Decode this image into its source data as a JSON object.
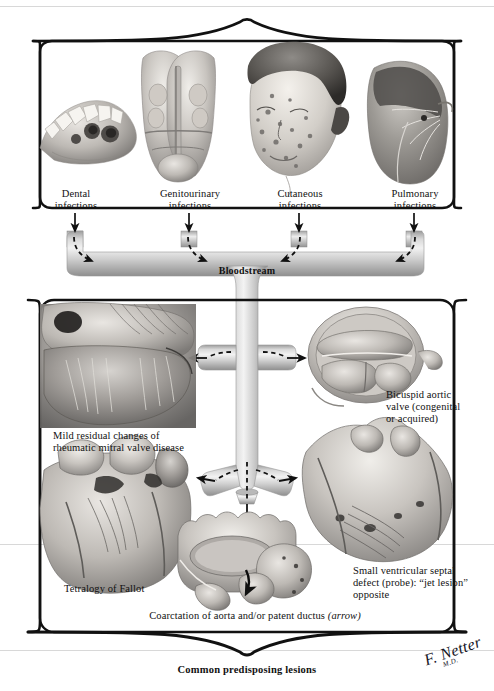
{
  "plate": {
    "width": 494,
    "height": 691,
    "background": "#ffffff",
    "ink": "#111111"
  },
  "title_caption": "Common predisposing lesions",
  "flow_label": "Bloodstream",
  "signature": {
    "name": "F. Netter",
    "credential": "M.D."
  },
  "top_panel": {
    "name": "sources-of-infection-panel",
    "items": [
      {
        "id": "dental",
        "label": "Dental\ninfections",
        "figure": "mandible-with-dental-caries-illustration"
      },
      {
        "id": "genitourinary",
        "label": "Genitourinary\ninfections",
        "figure": "prostate-bladder-coronal-section-illustration"
      },
      {
        "id": "cutaneous",
        "label": "Cutaneous\ninfections",
        "figure": "child-face-with-skin-lesions-illustration"
      },
      {
        "id": "pulmonary",
        "label": "Pulmonary\ninfections",
        "figure": "lung-with-consolidation-illustration"
      }
    ]
  },
  "bottom_panel": {
    "name": "cardiac-lesions-panel",
    "items": [
      {
        "id": "rheumatic-mitral",
        "label": "Mild residual changes of\nrheumatic mitral valve disease",
        "figure": "mitral-valve-rheumatic-changes-illustration"
      },
      {
        "id": "bicuspid-aortic",
        "label": "Bicuspid aortic\nvalve (congenital\nor acquired)",
        "figure": "bicuspid-aortic-valve-illustration"
      },
      {
        "id": "tetralogy-fallot",
        "label": "Tetralogy of Fallot",
        "figure": "tetralogy-of-fallot-heart-illustration"
      },
      {
        "id": "ventricular-septal-defect",
        "label": "Small ventricular septal\ndefect (probe): “jet lesion”\nopposite",
        "figure": "ventricular-septal-defect-illustration"
      },
      {
        "id": "coarctation",
        "label": "Coarctation of aorta and/or patent ductus ",
        "label_italic": "(arrow)",
        "figure": "coarctation-of-aorta-illustration"
      }
    ]
  }
}
